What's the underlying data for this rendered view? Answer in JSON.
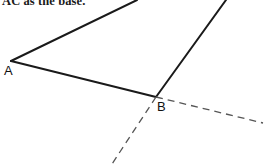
{
  "figure": {
    "caption": "AC as the base.",
    "background_color": "#ffffff",
    "stroke_color": "#1a1a1a",
    "dash_color": "#4d4d4d",
    "width": 273,
    "height": 164,
    "labels": {
      "a": "A",
      "b": "B"
    },
    "points": {
      "A": {
        "x": 11,
        "y": 61
      },
      "B": {
        "x": 156,
        "y": 97
      },
      "ray_up_left_end": {
        "x": 137,
        "y": 0
      },
      "ray_up_right_end": {
        "x": 226,
        "y": 0
      },
      "dash_lower_left_end": {
        "x": 112,
        "y": 164
      },
      "dash_lower_right_end": {
        "x": 263,
        "y": 123
      }
    },
    "segments": [
      {
        "name": "segment-A-to-upper",
        "from": "A",
        "to": "ray_up_left_end",
        "style": "solid",
        "width": 2
      },
      {
        "name": "segment-A-to-B",
        "from": "A",
        "to": "B",
        "style": "solid",
        "width": 2.2
      },
      {
        "name": "segment-B-to-upper-right",
        "from": "B",
        "to": "ray_up_right_end",
        "style": "solid",
        "width": 2
      },
      {
        "name": "dashed-ray-B-lower-left",
        "from": "B",
        "to": "dash_lower_left_end",
        "style": "dashed",
        "width": 1.3
      },
      {
        "name": "dashed-ray-B-lower-right",
        "from": "B",
        "to": "dash_lower_right_end",
        "style": "dashed",
        "width": 1.3
      }
    ]
  }
}
